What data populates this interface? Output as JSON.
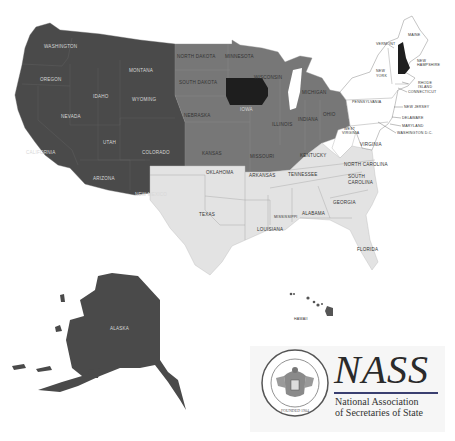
{
  "map": {
    "colors": {
      "west": "#4a4a4a",
      "midwest": "#777777",
      "highlight": "#1e1e1e",
      "south": "#e3e3e3",
      "northeast": "#ffffff",
      "border": "#bdbdbd"
    },
    "labels": {
      "washington": "WASHINGTON",
      "oregon": "OREGON",
      "california": "CALIFORNIA",
      "nevada": "NEVADA",
      "idaho": "IDAHO",
      "montana": "MONTANA",
      "wyoming": "WYOMING",
      "utah": "UTAH",
      "colorado": "COLORADO",
      "arizona": "ARIZONA",
      "new_mexico": "NEW MEXICO",
      "north_dakota": "NORTH DAKOTA",
      "south_dakota": "SOUTH DAKOTA",
      "nebraska": "NEBRASKA",
      "kansas": "KANSAS",
      "minnesota": "MINNESOTA",
      "iowa": "IOWA",
      "missouri": "MISSOURI",
      "wisconsin": "WISCONSIN",
      "illinois": "ILLINOIS",
      "michigan": "MICHIGAN",
      "indiana": "INDIANA",
      "ohio": "OHIO",
      "oklahoma": "OKLAHOMA",
      "texas": "TEXAS",
      "arkansas": "ARKANSAS",
      "louisiana": "LOUISIANA",
      "mississippi": "MISSISSIPPI",
      "alabama": "ALABAMA",
      "tennessee": "TENNESSEE",
      "kentucky": "KENTUCKY",
      "georgia": "GEORGIA",
      "florida": "FLORIDA",
      "south_carolina_1": "SOUTH",
      "south_carolina_2": "CAROLINA",
      "north_carolina": "NORTH CAROLINA",
      "virginia": "VIRGINIA",
      "west_virginia_1": "WEST",
      "west_virginia_2": "VIRGINIA",
      "pennsylvania": "PENNSYLVANIA",
      "new_york_1": "NEW",
      "new_york_2": "YORK",
      "vermont": "VERMONT",
      "maine": "MAINE",
      "new_hampshire_1": "NEW",
      "new_hampshire_2": "HAMPSHIRE",
      "rhode_island_1": "RHODE",
      "rhode_island_2": "ISLAND",
      "connecticut": "CONNECTICUT",
      "new_jersey": "NEW JERSEY",
      "delaware": "DELAWARE",
      "maryland": "MARYLAND",
      "washington_dc": "WASHINGTON D.C.",
      "alaska": "ALASKA",
      "hawaii": "HAWAII"
    }
  },
  "logo": {
    "title": "NASS",
    "subtitle_line1": "National Association",
    "subtitle_line2": "of Secretaries of State",
    "seal_text": "NATIONAL ASSOCIATION · SECRETARIES OF STATE",
    "seal_bottom": "FOUNDED 1904"
  }
}
